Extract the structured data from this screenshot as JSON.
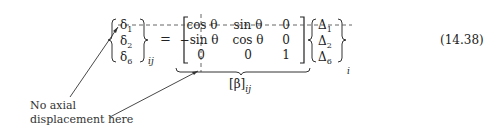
{
  "equation": {
    "number": "(14.38)",
    "lhs_vector": {
      "entries": [
        {
          "sym": "δ",
          "sub": "1"
        },
        {
          "sym": "δ",
          "sub": "2"
        },
        {
          "sym": "δ",
          "sub": "6"
        }
      ],
      "subscript": "ij"
    },
    "equals": "=",
    "matrix": {
      "rows": [
        [
          "cos θ",
          "sin θ",
          "0"
        ],
        [
          "−sin θ",
          "cos θ",
          "0"
        ],
        [
          "0",
          "0",
          "1"
        ]
      ],
      "label": "[β]",
      "label_subscript": "ij"
    },
    "rhs_vector": {
      "entries": [
        {
          "sym": "Δ",
          "sub": "1"
        },
        {
          "sym": "Δ",
          "sub": "2"
        },
        {
          "sym": "Δ",
          "sub": "6"
        }
      ],
      "subscript": "i"
    }
  },
  "annotation": {
    "line1": "No axial",
    "line2": "displacement here"
  }
}
